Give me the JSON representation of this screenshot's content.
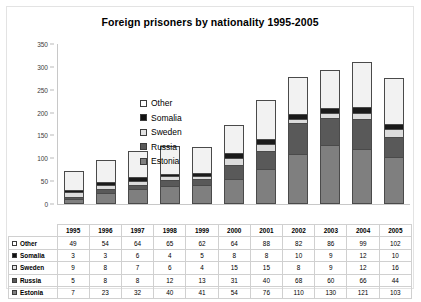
{
  "chart_data": {
    "type": "bar",
    "title": "Foreign prisoners by nationality 1995-2005",
    "xlabel": "",
    "ylabel": "",
    "stacked": true,
    "grid": false,
    "legend_position": "inside-top-left",
    "ylim": [
      0,
      350
    ],
    "yticks": [
      0,
      50,
      100,
      150,
      200,
      250,
      300,
      350
    ],
    "categories": [
      "1995",
      "1996",
      "1997",
      "1998",
      "1999",
      "2000",
      "2001",
      "2002",
      "2003",
      "2004",
      "2005"
    ],
    "series": [
      {
        "name": "Other",
        "color": "#f2f2f2",
        "values": [
          49,
          54,
          64,
          65,
          62,
          64,
          88,
          82,
          86,
          99,
          102
        ]
      },
      {
        "name": "Somalia",
        "color": "#1a1a1a",
        "values": [
          3,
          3,
          6,
          4,
          5,
          8,
          8,
          10,
          9,
          12,
          10
        ]
      },
      {
        "name": "Sweden",
        "color": "#dcdcdc",
        "values": [
          9,
          8,
          7,
          6,
          4,
          15,
          15,
          8,
          9,
          12,
          16
        ]
      },
      {
        "name": "Russia",
        "color": "#595959",
        "values": [
          5,
          8,
          8,
          12,
          13,
          31,
          40,
          68,
          60,
          66,
          44
        ]
      },
      {
        "name": "Estonia",
        "color": "#7f7f7f",
        "values": [
          7,
          23,
          32,
          40,
          41,
          54,
          76,
          110,
          130,
          121,
          103
        ]
      }
    ],
    "stack_order_bottom_to_top": [
      "Estonia",
      "Russia",
      "Sweden",
      "Somalia",
      "Other"
    ]
  },
  "table": {
    "corner_label": "",
    "column_headers": [
      "1995",
      "1996",
      "1997",
      "1998",
      "1999",
      "2000",
      "2001",
      "2002",
      "2003",
      "2004",
      "2005"
    ],
    "rows": [
      {
        "label": "Other",
        "key": "other",
        "values": [
          49,
          54,
          64,
          65,
          62,
          64,
          88,
          82,
          86,
          99,
          102
        ]
      },
      {
        "label": "Somalia",
        "key": "somalia",
        "values": [
          3,
          3,
          6,
          4,
          5,
          8,
          8,
          10,
          9,
          12,
          10
        ]
      },
      {
        "label": "Sweden",
        "key": "sweden",
        "values": [
          9,
          8,
          7,
          6,
          4,
          15,
          15,
          8,
          9,
          12,
          16
        ]
      },
      {
        "label": "Russia",
        "key": "russia",
        "values": [
          5,
          8,
          8,
          12,
          13,
          31,
          40,
          68,
          60,
          66,
          44
        ]
      },
      {
        "label": "Estonia",
        "key": "estonia",
        "values": [
          7,
          23,
          32,
          40,
          41,
          54,
          76,
          110,
          130,
          121,
          103
        ]
      }
    ]
  }
}
